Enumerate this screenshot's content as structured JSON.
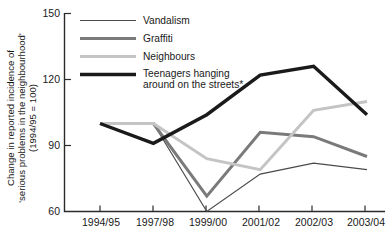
{
  "chart_data": {
    "type": "line",
    "title": "",
    "subtitle": "",
    "xlabel": "",
    "ylabel": "Change in reported incidence of 'serious problems in the neighbourhood' (1994/95 = 100)",
    "ylabel_line1": "Change in reported incidence of",
    "ylabel_line2": "'serious problems in the neighbourhood'",
    "ylabel_line3": "(1994/95 = 100)",
    "categories": [
      "1994/95",
      "1997/98",
      "1999/00",
      "2001/02",
      "2002/03",
      "2003/04"
    ],
    "ylim": [
      60,
      150
    ],
    "yticks": [
      60,
      90,
      120,
      150
    ],
    "ytick_labels": [
      "60",
      "90",
      "120",
      "150"
    ],
    "grid": false,
    "legend_position": "top-left-inside",
    "series": [
      {
        "name": "Vandalism",
        "values": [
          100,
          100,
          60,
          77,
          82,
          79
        ],
        "color": "#4a4a4a",
        "width": 1.2
      },
      {
        "name": "Graffiti",
        "values": [
          100,
          100,
          67,
          96,
          94,
          85
        ],
        "color": "#7a7a7a",
        "width": 3.0
      },
      {
        "name": "Neighbours",
        "values": [
          100,
          100,
          84,
          79,
          106,
          110
        ],
        "color": "#c4c4c4",
        "width": 3.0
      },
      {
        "name": "Teenagers hanging around on the streets*",
        "name_line1": "Teenagers hanging",
        "name_line2": "around on the streets*",
        "values": [
          100,
          91,
          104,
          122,
          126,
          104
        ],
        "color": "#1a1a1a",
        "width": 3.4
      }
    ],
    "annotations": [
      "*"
    ]
  },
  "legend": {
    "items": [
      {
        "label": "Vandalism",
        "color": "#4a4a4a",
        "width": 1.2
      },
      {
        "label": "Graffiti",
        "color": "#7a7a7a",
        "width": 3.0
      },
      {
        "label": "Neighbours",
        "color": "#c4c4c4",
        "width": 3.0
      },
      {
        "label_line1": "Teenagers hanging",
        "label_line2": "around on the streets*",
        "color": "#1a1a1a",
        "width": 3.4
      }
    ]
  },
  "colors": {
    "axis": "#2b2b2b",
    "text": "#1a1a1a",
    "background": "#ffffff"
  }
}
